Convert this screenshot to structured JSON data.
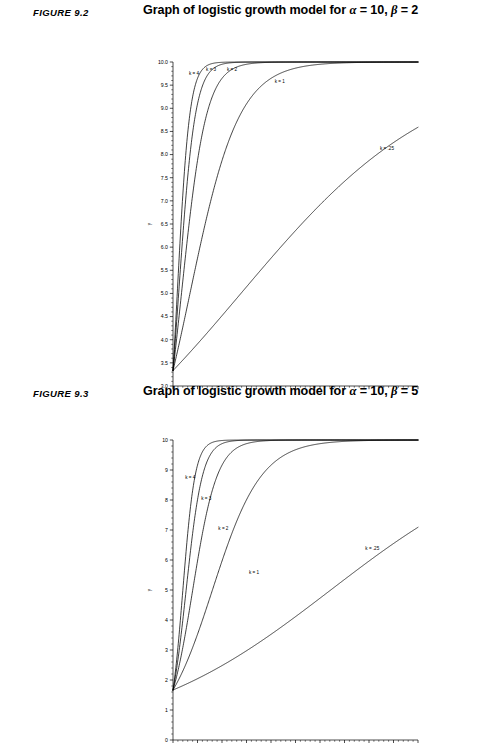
{
  "page": {
    "background": "#ffffff",
    "ink": "#000000"
  },
  "figures": [
    {
      "id": "figure-9-2",
      "label": "FIGURE 9.2",
      "title_prefix": "Graph of logistic growth model for ",
      "title_alpha": "α",
      "title_alpha_value": " = 10, ",
      "title_beta": "β",
      "title_beta_value": " = 2",
      "title_plain": "Graph of logistic growth model for α = 10, β = 2",
      "xlabel": "x",
      "ylabel": "y",
      "chart_data": {
        "type": "line",
        "title": "Graph of logistic growth model for α = 10, β = 2",
        "xlabel": "x",
        "ylabel": "y",
        "xlim": [
          0,
          10
        ],
        "ylim": [
          3.0,
          10.0
        ],
        "xticks": [
          0,
          1,
          2,
          3,
          4,
          5,
          6,
          7,
          8,
          9,
          10
        ],
        "xticklabels": [
          "0",
          "1",
          "2",
          "3",
          "4",
          "5",
          "6",
          "7",
          "8",
          "9",
          "10"
        ],
        "yticks": [
          3.0,
          3.5,
          4.0,
          4.5,
          5.0,
          5.5,
          6.0,
          6.5,
          7.0,
          7.5,
          8.0,
          8.5,
          9.0,
          9.5,
          10.0
        ],
        "yticklabels": [
          "3.0",
          "3.5",
          "4.0",
          "4.5",
          "5.0",
          "5.5",
          "6.0",
          "6.5",
          "7.0",
          "7.5",
          "8.0",
          "8.5",
          "9.0",
          "9.5",
          "10.0"
        ],
        "y_minor_per_major": 5,
        "x_minor_per_major": 5,
        "grid": false,
        "legend": "inline-curve-labels",
        "model": "y = alpha / (1 + beta * exp(-k*x))",
        "alpha": 10,
        "beta": 2,
        "y_at_x0": 3.333,
        "series": [
          {
            "name": "k = 4",
            "k": 4,
            "label": "k = 4",
            "label_x": 0.65,
            "label_y": 9.72
          },
          {
            "name": "k = 3",
            "k": 3,
            "label": "k = 3",
            "label_x": 1.35,
            "label_y": 9.8
          },
          {
            "name": "k = 2",
            "k": 2,
            "label": "k = 2",
            "label_x": 2.2,
            "label_y": 9.8
          },
          {
            "name": "k = 1",
            "k": 1,
            "label": "k = 1",
            "label_x": 4.15,
            "label_y": 9.55
          },
          {
            "name": "k = .25",
            "k": 0.25,
            "label": "k = .25",
            "label_x": 8.45,
            "label_y": 8.1
          }
        ]
      }
    },
    {
      "id": "figure-9-3",
      "label": "FIGURE 9.3",
      "title_prefix": "Graph of logistic growth model for ",
      "title_alpha": "α",
      "title_alpha_value": " = 10, ",
      "title_beta": "β",
      "title_beta_value": " = 5",
      "title_plain": "Graph of logistic growth model for α = 10, β = 5",
      "xlabel": "x",
      "ylabel": "y",
      "chart_data": {
        "type": "line",
        "title": "Graph of logistic growth model for α = 10, β = 5",
        "xlabel": "x",
        "ylabel": "y",
        "xlim": [
          0,
          10
        ],
        "ylim": [
          0,
          10
        ],
        "xticks": [
          0,
          1,
          2,
          3,
          4,
          5,
          6,
          7,
          8,
          9,
          10
        ],
        "xticklabels": [
          "0",
          "1",
          "2",
          "3",
          "4",
          "5",
          "6",
          "7",
          "8",
          "9",
          "10"
        ],
        "yticks": [
          0,
          1,
          2,
          3,
          4,
          5,
          6,
          7,
          8,
          9,
          10
        ],
        "yticklabels": [
          "0",
          "1",
          "2",
          "3",
          "4",
          "5",
          "6",
          "7",
          "8",
          "9",
          "10"
        ],
        "y_minor_per_major": 5,
        "x_minor_per_major": 5,
        "grid": false,
        "legend": "inline-curve-labels",
        "model": "y = alpha / (1 + beta * exp(-k*x))",
        "alpha": 10,
        "beta": 5,
        "y_at_x0": 1.667,
        "series": [
          {
            "name": "k = 4",
            "k": 4,
            "label": "k = 4",
            "label_x": 0.5,
            "label_y": 8.7
          },
          {
            "name": "k = 3",
            "k": 3,
            "label": "k = 3",
            "label_x": 1.15,
            "label_y": 8.0
          },
          {
            "name": "k = 2",
            "k": 2,
            "label": "k = 2",
            "label_x": 1.85,
            "label_y": 7.0
          },
          {
            "name": "k = 1",
            "k": 1,
            "label": "k = 1",
            "label_x": 3.1,
            "label_y": 5.55
          },
          {
            "name": "k = .25",
            "k": 0.25,
            "label": "k = .25",
            "label_x": 7.85,
            "label_y": 6.35
          }
        ]
      }
    }
  ]
}
